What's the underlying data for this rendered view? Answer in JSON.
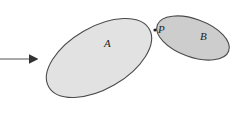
{
  "diagram": {
    "bodies": [
      {
        "id": "A",
        "label": "A",
        "fill": "#e2e2e2",
        "stroke": "#4a4a4a"
      },
      {
        "id": "B",
        "label": "B",
        "fill": "#cdcdcd",
        "stroke": "#4a4a4a"
      }
    ],
    "contact_point": {
      "label": "P"
    },
    "arrow": {
      "color": "#333333",
      "direction": "right"
    }
  }
}
